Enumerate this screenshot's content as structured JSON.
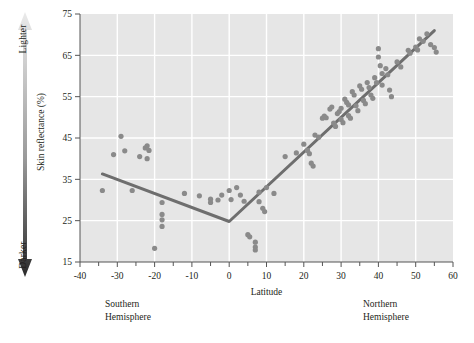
{
  "figure": {
    "gradient_arrow": {
      "top_label": "Lighter",
      "bottom_label": "Darker",
      "top_color": "#e8e8e8",
      "bottom_color": "#2b2b2b"
    },
    "captions": {
      "southern": "Southern\nHemisphere",
      "northern": "Northern\nHemisphere"
    }
  },
  "chart_data": {
    "type": "scatter",
    "title": "",
    "xlabel": "Latitude",
    "ylabel": "Skin reflectance (%)",
    "xlim": [
      -40,
      60
    ],
    "ylim": [
      15,
      75
    ],
    "xticks": [
      -40,
      -30,
      -20,
      -10,
      0,
      10,
      20,
      30,
      40,
      50,
      60
    ],
    "xtick_labels": [
      "-40",
      "-30",
      "-20",
      "-10",
      "0",
      "10",
      "20",
      "30",
      "40",
      "50",
      "60"
    ],
    "xminor_tick_step": 5,
    "yticks": [
      15,
      25,
      35,
      45,
      55,
      65,
      75
    ],
    "ytick_labels": [
      "15",
      "25",
      "35",
      "45",
      "55",
      "65",
      "75"
    ],
    "grid": "horizontal-and-vertical-white",
    "plot_background": "#e6e6e6",
    "point_color": "#8a8a8a",
    "point_radius": 2.6,
    "legend": "none",
    "series": [
      {
        "name": "Skin reflectance by latitude",
        "points": [
          [
            -34,
            32.3
          ],
          [
            -29,
            45.4
          ],
          [
            -28,
            41.9
          ],
          [
            -26,
            32.3
          ],
          [
            -22.5,
            42.6
          ],
          [
            -22,
            43.1
          ],
          [
            -21.5,
            42.0
          ],
          [
            -22,
            40.0
          ],
          [
            -20,
            18.3
          ],
          [
            -18,
            29.4
          ],
          [
            -18,
            26.5
          ],
          [
            -18,
            25.2
          ],
          [
            -18,
            23.6
          ],
          [
            -12,
            31.6
          ],
          [
            -8,
            31.0
          ],
          [
            -5,
            30.2
          ],
          [
            -5,
            29.4
          ],
          [
            -3,
            30.0
          ],
          [
            -2,
            31.2
          ],
          [
            0,
            32.3
          ],
          [
            0.5,
            30.1
          ],
          [
            2,
            33.0
          ],
          [
            3,
            31.2
          ],
          [
            4,
            29.7
          ],
          [
            5,
            21.6
          ],
          [
            5.5,
            21.1
          ],
          [
            7,
            19.8
          ],
          [
            7,
            18.6
          ],
          [
            7,
            17.9
          ],
          [
            8,
            31.9
          ],
          [
            8,
            29.6
          ],
          [
            9,
            28.0
          ],
          [
            9.5,
            27.2
          ],
          [
            10,
            33.0
          ],
          [
            12,
            31.6
          ],
          [
            15,
            40.5
          ],
          [
            18,
            41.4
          ],
          [
            20,
            43.5
          ],
          [
            21,
            42.0
          ],
          [
            21.5,
            41.2
          ],
          [
            22,
            38.9
          ],
          [
            22.5,
            38.2
          ],
          [
            23,
            45.7
          ],
          [
            24,
            45.2
          ],
          [
            25,
            49.8
          ],
          [
            25.5,
            50.3
          ],
          [
            26,
            49.9
          ],
          [
            27,
            52.0
          ],
          [
            27.5,
            52.5
          ],
          [
            28,
            48.6
          ],
          [
            28.5,
            47.8
          ],
          [
            29,
            50.9
          ],
          [
            29.5,
            51.4
          ],
          [
            30,
            52.2
          ],
          [
            30,
            49.5
          ],
          [
            30.5,
            48.7
          ],
          [
            31,
            54.4
          ],
          [
            31.5,
            53.6
          ],
          [
            32,
            53.0
          ],
          [
            32,
            50.4
          ],
          [
            32.5,
            49.8
          ],
          [
            33,
            56.2
          ],
          [
            33.5,
            55.4
          ],
          [
            34,
            52.8
          ],
          [
            34.5,
            51.6
          ],
          [
            35,
            57.6
          ],
          [
            35.5,
            56.8
          ],
          [
            36,
            54.1
          ],
          [
            36.5,
            53.3
          ],
          [
            37,
            58.4
          ],
          [
            37.5,
            57.2
          ],
          [
            38,
            55.4
          ],
          [
            38.5,
            54.6
          ],
          [
            39,
            59.6
          ],
          [
            39.5,
            58.4
          ],
          [
            40,
            66.6
          ],
          [
            40,
            64.6
          ],
          [
            40.5,
            62.5
          ],
          [
            41,
            60.6
          ],
          [
            41,
            57.8
          ],
          [
            42,
            61.8
          ],
          [
            42.5,
            60.3
          ],
          [
            43,
            56.6
          ],
          [
            43.5,
            55.0
          ],
          [
            45,
            63.4
          ],
          [
            46,
            62.2
          ],
          [
            48,
            66.2
          ],
          [
            48.5,
            65.5
          ],
          [
            50,
            67.0
          ],
          [
            50.5,
            66.3
          ],
          [
            51,
            69.0
          ],
          [
            52,
            68.4
          ],
          [
            53,
            70.2
          ],
          [
            54,
            67.6
          ],
          [
            55,
            66.9
          ],
          [
            55.5,
            65.8
          ],
          [
            -31,
            41.0
          ],
          [
            -24,
            40.5
          ]
        ]
      }
    ],
    "trend_line": {
      "color": "#6e6e6e",
      "width": 3,
      "vertices": [
        [
          -34,
          36.3
        ],
        [
          0,
          24.8
        ],
        [
          55,
          71.0
        ]
      ]
    }
  }
}
